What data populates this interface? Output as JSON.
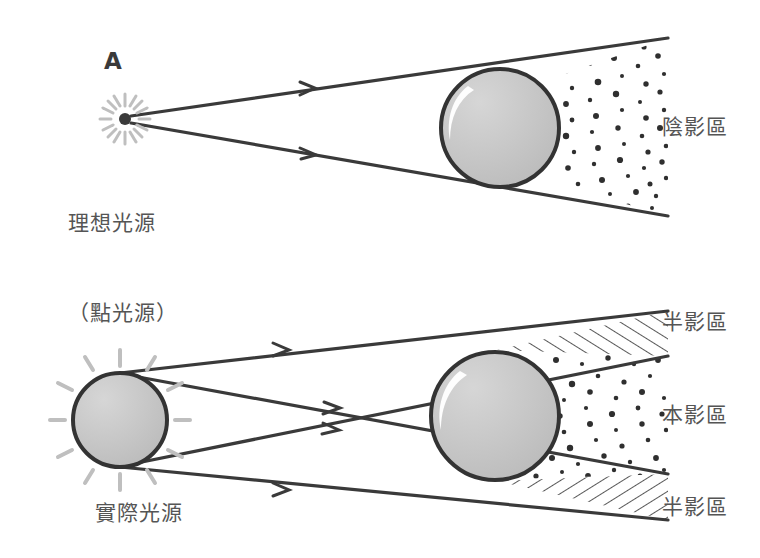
{
  "figure": {
    "marker": "A",
    "width": 760,
    "height": 558,
    "background": "#ffffff",
    "colors": {
      "stroke": "#3a3a3a",
      "sphere_fill": "#c6c6c6",
      "sphere_stroke": "#333333",
      "highlight": "#ffffff",
      "burst_ray": "#bfbfbf",
      "dot": "#2f2f2f",
      "text": "#555555"
    }
  },
  "labels": {
    "marker_a": "A",
    "ideal_source_line1": "理想光源",
    "ideal_source_line2": "（點光源）",
    "actual_source": "實際光源",
    "shadow_zone": "陰影區",
    "penumbra_top": "半影區",
    "umbra": "本影區",
    "penumbra_bottom": "半影區"
  },
  "diagrams": [
    {
      "name": "point-source-shadow",
      "source_type": "point",
      "source": {
        "x": 125,
        "y": 119,
        "radius": 6
      },
      "object_sphere": {
        "cx": 500,
        "cy": 128,
        "r": 59
      },
      "rays": [
        {
          "from": [
            131,
            116
          ],
          "to": [
            668,
            38
          ]
        },
        {
          "from": [
            131,
            123
          ],
          "to": [
            668,
            216
          ]
        }
      ],
      "shadow_region": "陰影區",
      "shadow_style": "stippled"
    },
    {
      "name": "extended-source-shadow",
      "source_type": "extended",
      "source_sphere": {
        "cx": 120,
        "cy": 420,
        "r": 47
      },
      "object_sphere": {
        "cx": 495,
        "cy": 416,
        "r": 64
      },
      "rays": [
        {
          "from": [
            120,
            373
          ],
          "to": [
            668,
            311
          ]
        },
        {
          "from": [
            120,
            467
          ],
          "to": [
            668,
            520
          ]
        },
        {
          "from": [
            122,
            374
          ],
          "to": [
            668,
            474
          ]
        },
        {
          "from": [
            122,
            466
          ],
          "to": [
            668,
            356
          ]
        }
      ],
      "regions": [
        {
          "name": "半影區",
          "style": "hatched"
        },
        {
          "name": "本影區",
          "style": "stippled"
        },
        {
          "name": "半影區",
          "style": "hatched"
        }
      ]
    }
  ]
}
